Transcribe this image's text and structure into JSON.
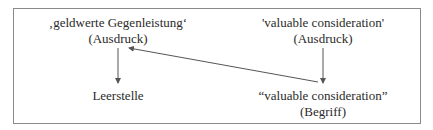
{
  "diagram": {
    "type": "semantic-mapping-diagram",
    "left": {
      "expression": {
        "term": "‚geldwerte Gegenleistung‘",
        "kind": "(Ausdruck)"
      },
      "concept": {
        "term": "Leerstelle"
      }
    },
    "right": {
      "expression": {
        "term": "'valuable consideration'",
        "kind": "(Ausdruck)"
      },
      "concept": {
        "term": "“valuable consideration”",
        "kind": "(Begriff)"
      }
    },
    "edges": [
      {
        "from": "left.expression",
        "to": "left.concept",
        "style": "vertical-arrow"
      },
      {
        "from": "right.expression",
        "to": "right.concept",
        "style": "vertical-arrow"
      },
      {
        "from": "right.concept",
        "to": "left.expression",
        "style": "diagonal-arrow"
      }
    ],
    "colors": {
      "text": "#2a2a2a",
      "line": "#555555",
      "frame": "#8a8a8a",
      "background": "#ffffff"
    }
  }
}
